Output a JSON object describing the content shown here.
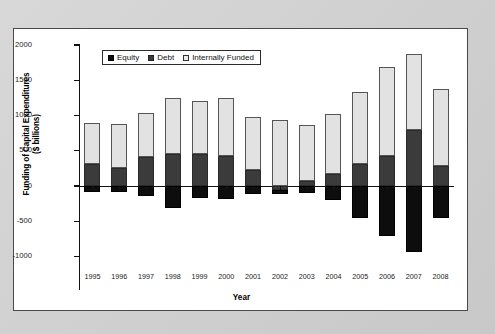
{
  "chart_data": {
    "type": "bar",
    "subtype": "stacked-bar-with-negatives",
    "title": "",
    "xlabel": "Year",
    "ylabel": "Funding of Capital Expenditures ($ billions)",
    "ylabel_line1": "Funding of Capital Expenditures",
    "ylabel_line2": "($ billions)",
    "ylim": [
      -1250,
      2000
    ],
    "yticks": [
      2000,
      1500,
      1000,
      500,
      0,
      -500,
      -1000
    ],
    "ytick_labels": [
      "2000",
      "1500",
      "1000",
      "500",
      "0",
      "-500",
      "-1000"
    ],
    "grid": false,
    "legend_position": "top-left-inside",
    "categories": [
      "1995",
      "1996",
      "1997",
      "1998",
      "1999",
      "2000",
      "2001",
      "2002",
      "2003",
      "2004",
      "2005",
      "2006",
      "2007",
      "2008"
    ],
    "series": [
      {
        "name": "Equity",
        "color": "#0d0d0d",
        "values": [
          -90,
          -80,
          -140,
          -310,
          -170,
          -185,
          -120,
          -60,
          -100,
          -200,
          -450,
          -710,
          -930,
          -455
        ]
      },
      {
        "name": "Debt",
        "color": "#3b3b3b",
        "values": [
          310,
          260,
          410,
          460,
          460,
          425,
          225,
          -55,
          65,
          175,
          305,
          430,
          800,
          285
        ]
      },
      {
        "name": "Internally Funded",
        "color": "#e2e2e2",
        "values": [
          590,
          625,
          630,
          790,
          750,
          830,
          755,
          935,
          800,
          840,
          1035,
          1255,
          1070,
          1095
        ]
      }
    ],
    "positive_totals": [
      900,
      885,
      1040,
      1250,
      1210,
      1255,
      980,
      880,
      865,
      1015,
      1340,
      1685,
      1870,
      1380
    ],
    "negative_totals": [
      -90,
      -80,
      -140,
      -310,
      -170,
      -185,
      -120,
      -115,
      -100,
      -200,
      -450,
      -710,
      -930,
      -455
    ]
  },
  "legend": {
    "items": [
      {
        "label": "Equity",
        "swatch": "equity"
      },
      {
        "label": "Debt",
        "swatch": "debt"
      },
      {
        "label": "Internally Funded",
        "swatch": "internal"
      }
    ]
  }
}
